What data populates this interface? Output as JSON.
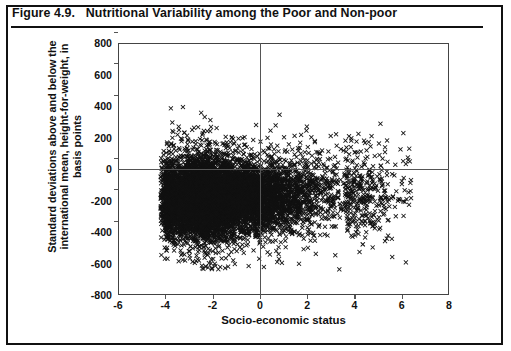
{
  "figure": {
    "title": "Figure 4.9.   Nutritional Variability among the Poor and Non-poor"
  },
  "chart_data": {
    "type": "scatter",
    "title": "Figure 4.9.   Nutritional Variability among the Poor and Non-poor",
    "xlabel": "Socio-economic status",
    "ylabel": "Standard deviations above and below the international mean, height-for-weight, in basis points",
    "ylabel_lines": [
      "Standard deviations above and below the",
      "international mean, height-for-weight, in",
      "basis points"
    ],
    "xlim": [
      -6,
      8
    ],
    "ylim": [
      -800,
      800
    ],
    "xticks": [
      -6,
      -4,
      -2,
      0,
      2,
      4,
      6,
      8
    ],
    "yticks": [
      -800,
      -600,
      -400,
      -200,
      0,
      200,
      400,
      600,
      800
    ],
    "grid": false,
    "legend": null,
    "marker": "x",
    "marker_color": "#111111",
    "reference_lines": [
      {
        "axis": "horizontal",
        "value": 0
      },
      {
        "axis": "vertical",
        "value": 0
      }
    ],
    "n_points": 4200,
    "distribution": {
      "x_range_observed": [
        -4.2,
        6.4
      ],
      "y_range_observed": [
        -640,
        620
      ],
      "y_core_center": -170,
      "y_core_spread": 150,
      "x_mode": -2.6,
      "correlation": 0.12
    }
  }
}
